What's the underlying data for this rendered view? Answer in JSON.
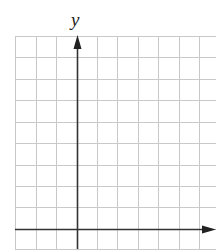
{
  "chart_data": {
    "type": "empty-coordinate-grid",
    "title": "",
    "xlabel": "",
    "ylabel": "y",
    "grid": true,
    "grid_color": "#c9c9c9",
    "axis_color": "#333333",
    "columns_left_of_y_axis": 3,
    "columns_right_of_y_axis": 7,
    "rows_above_x_axis": 9,
    "rows_below_x_axis": 1,
    "data_points": [],
    "series": []
  },
  "labels": {
    "y_axis": "y"
  },
  "geometry": {
    "x_lines": [
      15,
      36,
      56,
      77,
      97,
      117,
      138,
      158,
      179,
      199
    ],
    "y_lines": [
      36,
      57,
      79,
      100,
      122,
      143,
      165,
      186,
      207,
      229,
      249
    ],
    "grid_left": 15,
    "grid_right": 216,
    "grid_top": 36,
    "grid_bottom": 249,
    "y_axis_x": 77,
    "x_axis_y": 229
  }
}
